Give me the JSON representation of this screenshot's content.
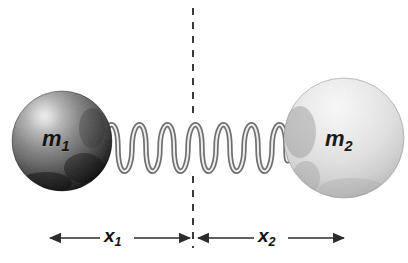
{
  "figure": {
    "type": "physics-diagram",
    "background_color": "#ffffff"
  },
  "masses": [
    {
      "id": "mass-left",
      "label": "m",
      "subscript": "1",
      "shade": "dark-gray",
      "fill_light": "#b9b9b9",
      "fill_dark": "#111111",
      "center_x": 62,
      "center_y": 141,
      "radius": 50
    },
    {
      "id": "mass-right",
      "label": "m",
      "subscript": "2",
      "shade": "light-gray",
      "fill_light": "#f2f2f2",
      "fill_dark": "#b0b0b0",
      "center_x": 344,
      "center_y": 138,
      "radius": 60
    }
  ],
  "spring": {
    "id": "connecting-spring",
    "coil_count": 13,
    "stroke_color": "#8c8c8c",
    "highlight_color": "#e8e8e8",
    "left_x": 104,
    "right_x": 292,
    "center_y": 148,
    "amplitude": 35
  },
  "reference_line": {
    "id": "equilibrium-dashed-line",
    "x": 193,
    "top_y": 8,
    "bottom_y": 248,
    "style": "dashed",
    "color": "#3a3a3a"
  },
  "dimensions": [
    {
      "id": "dimension-x1",
      "label": "x",
      "subscript": "1",
      "from_x": 48,
      "to_x": 190,
      "y": 238,
      "arrow_ends": "both",
      "color": "#2b2b2b"
    },
    {
      "id": "dimension-x2",
      "label": "x",
      "subscript": "2",
      "from_x": 196,
      "to_x": 346,
      "y": 238,
      "arrow_ends": "both",
      "color": "#2b2b2b"
    }
  ]
}
